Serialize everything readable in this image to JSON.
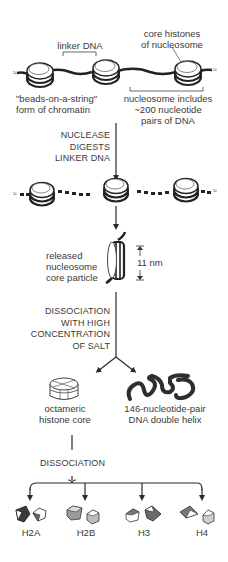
{
  "diagram": {
    "top": {
      "linker_label": "linker DNA",
      "core_histones_label": [
        "core histones",
        "of nucleosome"
      ],
      "beads_label": [
        "\"beads-on-a-string\"",
        "form of chromatin"
      ],
      "nucleosome_includes_label": [
        "nucleosome includes",
        "~200 nucleotide",
        "pairs of DNA"
      ]
    },
    "step1": {
      "label": [
        "NUCLEASE",
        "DIGESTS",
        "LINKER DNA"
      ]
    },
    "released": {
      "label": [
        "released",
        "nucleosome",
        "core particle"
      ],
      "size_label": "11 nm"
    },
    "step2": {
      "label": [
        "DISSOCIATION",
        "WITH HIGH",
        "CONCENTRATION",
        "OF SALT"
      ]
    },
    "products": {
      "octamer_label": [
        "octameric",
        "histone core"
      ],
      "dna_label": [
        "146-nucleotide-pair",
        "DNA double helix"
      ]
    },
    "step3": {
      "label": "DISSOCIATION"
    },
    "histones": [
      {
        "name": "H2A"
      },
      {
        "name": "H2B"
      },
      {
        "name": "H3"
      },
      {
        "name": "H4"
      }
    ],
    "colors": {
      "line": "#2b2b2b",
      "text": "#3a3a3a",
      "shade_dark": "#555555",
      "shade_mid": "#8a8a8a",
      "shade_light": "#bdbdbd"
    }
  }
}
